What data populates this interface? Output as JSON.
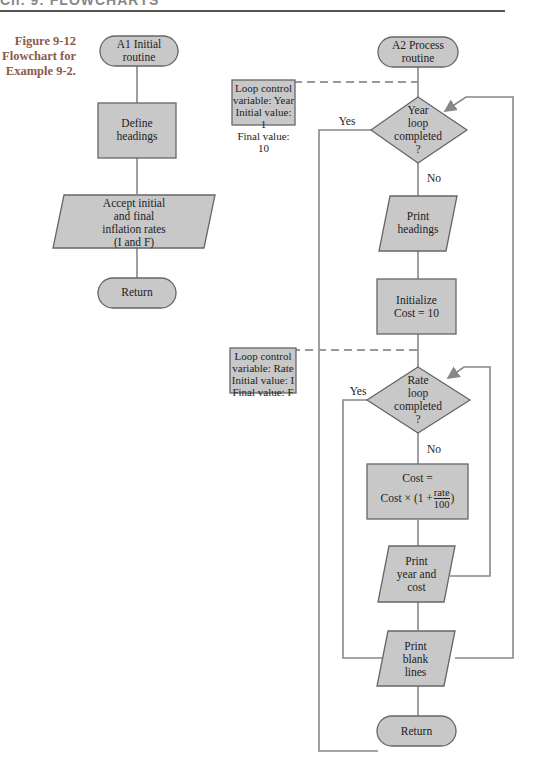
{
  "header": {
    "cut_text": "Ch. 9: FLOWCHARTS"
  },
  "caption": {
    "line1": "Figure 9-12",
    "line2": "Flowchart for",
    "line3": "Example 9-2."
  },
  "colors": {
    "fill": "#c8c8c8",
    "stroke": "#777777",
    "caption": "#8a5a4a"
  },
  "left": {
    "start": {
      "line1": "A1 Initial",
      "line2": "routine"
    },
    "define": {
      "line1": "Define",
      "line2": "headings"
    },
    "accept": {
      "line1": "Accept initial",
      "line2": "and final",
      "line3": "inflation rates",
      "line4": "(I and F)"
    },
    "return": "Return"
  },
  "right": {
    "start": {
      "line1": "A2 Process",
      "line2": "routine"
    },
    "year_note": {
      "line1": "Loop control",
      "line2": "variable:  Year",
      "line3": "Initial value:  1",
      "line4": "Final value:  10"
    },
    "year_decision": {
      "line1": "Year",
      "line2": "loop",
      "line3": "completed",
      "line4": "?"
    },
    "year_yes": "Yes",
    "year_no": "No",
    "print_headings": {
      "line1": "Print",
      "line2": "headings"
    },
    "init_cost": {
      "line1": "Initialize",
      "line2": "Cost = 10"
    },
    "rate_note": {
      "line1": "Loop control",
      "line2": "variable:  Rate",
      "line3": "Initial value:  I",
      "line4": "Final value:  F"
    },
    "rate_decision": {
      "line1": "Rate",
      "line2": "loop",
      "line3": "completed",
      "line4": "?"
    },
    "rate_yes": "Yes",
    "rate_no": "No",
    "cost_calc": {
      "line1": "Cost =",
      "line2_prefix": "Cost × (1 + ",
      "frac_num": "rate",
      "frac_den": "100",
      "line2_suffix": ")"
    },
    "print_year_cost": {
      "line1": "Print",
      "line2": "year and",
      "line3": "cost"
    },
    "print_blank": {
      "line1": "Print",
      "line2": "blank",
      "line3": "lines"
    },
    "return": "Return"
  }
}
